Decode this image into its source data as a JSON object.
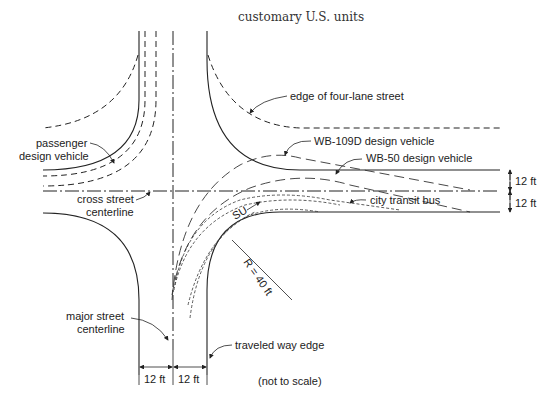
{
  "title": "customary U.S. units",
  "labels": {
    "edge_four_lane": "edge of four-lane street",
    "passenger_line1": "passenger",
    "passenger_line2": "design vehicle",
    "wb109d": "WB-109D design vehicle",
    "wb50": "WB-50 design vehicle",
    "cross_line1": "cross street",
    "cross_line2": "centerline",
    "city_bus": "city transit bus",
    "su": "SU",
    "radius": "R = 40 ft",
    "major_line1": "major street",
    "major_line2": "centerline",
    "traveled_way": "traveled way edge",
    "not_to_scale": "(not to scale)"
  },
  "dimensions": {
    "right_upper": "12 ft",
    "right_lower": "12 ft",
    "bottom_left": "12 ft",
    "bottom_right": "12 ft"
  }
}
